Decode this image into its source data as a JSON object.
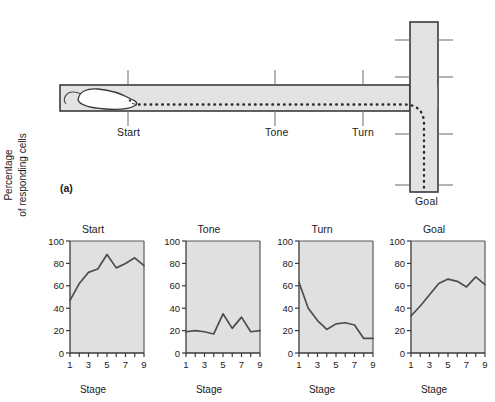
{
  "figure": {
    "panel_a_letter": "(a)",
    "panel_b_letter": "(b)"
  },
  "maze": {
    "name": "t-maze-diagram",
    "fill_color": "#e3e3e3",
    "stroke_color": "#3a3a3a",
    "path_style": "dotted",
    "markers": [
      {
        "id": "start",
        "label": "Start"
      },
      {
        "id": "tone",
        "label": "Tone"
      },
      {
        "id": "turn",
        "label": "Turn"
      },
      {
        "id": "goal",
        "label": "Goal"
      }
    ],
    "animal": "rat-outline"
  },
  "charts": {
    "y_axis_label_line1": "Percentage",
    "y_axis_label_line2": "of responding cells",
    "x_axis_label": "Stage",
    "y_ticks": [
      0,
      20,
      40,
      60,
      80,
      100
    ],
    "x_ticks": [
      1,
      2,
      3,
      4,
      5,
      6,
      7,
      8,
      9
    ],
    "x_tick_labels": [
      "1",
      "",
      "3",
      "",
      "5",
      "",
      "7",
      "",
      "9"
    ],
    "plot_bg": "#e0e0e0",
    "line_color": "#4d4d4d"
  },
  "chart_data": [
    {
      "type": "line",
      "title": "Start",
      "xlabel": "Stage",
      "ylabel": "Percentage of responding cells",
      "x": [
        1,
        2,
        3,
        4,
        5,
        6,
        7,
        8,
        9
      ],
      "values": [
        47,
        62,
        72,
        75,
        88,
        76,
        80,
        85,
        78
      ],
      "xlim": [
        1,
        9
      ],
      "ylim": [
        0,
        100
      ],
      "grid": false,
      "legend": "none"
    },
    {
      "type": "line",
      "title": "Tone",
      "xlabel": "Stage",
      "ylabel": "Percentage of responding cells",
      "x": [
        1,
        2,
        3,
        4,
        5,
        6,
        7,
        8,
        9
      ],
      "values": [
        19,
        20,
        19,
        17,
        35,
        22,
        32,
        19,
        20
      ],
      "xlim": [
        1,
        9
      ],
      "ylim": [
        0,
        100
      ],
      "grid": false,
      "legend": "none"
    },
    {
      "type": "line",
      "title": "Turn",
      "xlabel": "Stage",
      "ylabel": "Percentage of responding cells",
      "x": [
        1,
        2,
        3,
        4,
        5,
        6,
        7,
        8,
        9
      ],
      "values": [
        63,
        40,
        29,
        21,
        26,
        27,
        25,
        13,
        13
      ],
      "xlim": [
        1,
        9
      ],
      "ylim": [
        0,
        100
      ],
      "grid": false,
      "legend": "none"
    },
    {
      "type": "line",
      "title": "Goal",
      "xlabel": "Stage",
      "ylabel": "Percentage of responding cells",
      "x": [
        1,
        2,
        3,
        4,
        5,
        6,
        7,
        8,
        9
      ],
      "values": [
        33,
        42,
        52,
        62,
        66,
        64,
        59,
        68,
        61
      ],
      "xlim": [
        1,
        9
      ],
      "ylim": [
        0,
        100
      ],
      "grid": false,
      "legend": "none"
    }
  ]
}
